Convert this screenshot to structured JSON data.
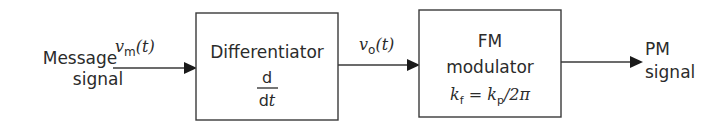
{
  "diagram": {
    "type": "block-diagram",
    "input": {
      "line1": "Message",
      "line2": "signal"
    },
    "edges": [
      {
        "from": "input",
        "to": "differentiator",
        "label_main": "v",
        "label_sub": "m",
        "label_arg": "(t)"
      },
      {
        "from": "differentiator",
        "to": "fm-modulator",
        "label_main": "v",
        "label_sub": "o",
        "label_arg": "(t)"
      },
      {
        "from": "fm-modulator",
        "to": "output",
        "label_main": "",
        "label_sub": "",
        "label_arg": ""
      }
    ],
    "blocks": {
      "differentiator": {
        "title": "Differentiator",
        "numerator": "d",
        "denominator": "dt_d",
        "denominator_var": "t"
      },
      "fm_modulator": {
        "line1": "FM",
        "line2": "modulator",
        "eq_k1": "k",
        "eq_sub1": "f",
        "eq_mid": " = ",
        "eq_k2": "k",
        "eq_sub2": "p",
        "eq_tail": "/2π"
      }
    },
    "output": {
      "line1": "PM",
      "line2": "signal"
    }
  }
}
